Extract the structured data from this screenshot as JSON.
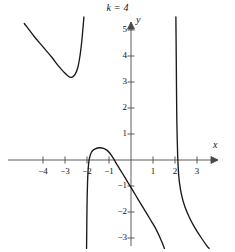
{
  "chart_data": {
    "type": "line",
    "title": "k = 4",
    "xlabel": "x",
    "ylabel": "y",
    "xlim": [
      -4.9,
      4.0
    ],
    "ylim": [
      -3.4,
      5.5
    ],
    "grid": false,
    "legend": null,
    "xticks": [
      -4,
      -3,
      -2,
      -1,
      1,
      2,
      3
    ],
    "xticklabels": [
      "-4",
      "-3",
      "-2",
      "-1",
      "1",
      "2",
      "3"
    ],
    "yticks": [
      5,
      4,
      3,
      2,
      1,
      -1,
      -2,
      -3
    ],
    "yticklabels": [
      "5",
      "4",
      "3",
      "2",
      "1",
      "-1",
      "-2",
      "-3"
    ],
    "asymptotes_vertical": [
      -2.05,
      2.05
    ],
    "annotations": [],
    "series": [
      {
        "name": "branch-left",
        "note": "upper-left branch, decreasing then rising to vertical asymptote x = -2.05; minimum about (-2.8, 3.2)",
        "points": [
          [
            -4.85,
            5.25
          ],
          [
            -4.4,
            4.75
          ],
          [
            -4.0,
            4.35
          ],
          [
            -3.6,
            3.95
          ],
          [
            -3.3,
            3.62
          ],
          [
            -3.05,
            3.38
          ],
          [
            -2.85,
            3.22
          ],
          [
            -2.7,
            3.18
          ],
          [
            -2.55,
            3.28
          ],
          [
            -2.42,
            3.55
          ],
          [
            -2.32,
            4.0
          ],
          [
            -2.24,
            4.55
          ],
          [
            -2.18,
            5.1
          ],
          [
            -2.14,
            5.5
          ]
        ]
      },
      {
        "name": "branch-middle",
        "note": "middle branch between asymptotes x = -2.05 and x = 2.05; local maximum about (-1.25, 0.45), falls through origin region to -3.4",
        "points": [
          [
            -2.02,
            -3.4
          ],
          [
            -2.01,
            -2.6
          ],
          [
            -2.0,
            -1.8
          ],
          [
            -1.98,
            -1.0
          ],
          [
            -1.95,
            -0.4
          ],
          [
            -1.9,
            0.02
          ],
          [
            -1.8,
            0.3
          ],
          [
            -1.65,
            0.42
          ],
          [
            -1.45,
            0.47
          ],
          [
            -1.25,
            0.45
          ],
          [
            -1.1,
            0.38
          ],
          [
            -0.95,
            0.25
          ],
          [
            -0.8,
            0.06
          ],
          [
            -0.62,
            -0.2
          ],
          [
            -0.4,
            -0.5
          ],
          [
            -0.15,
            -0.85
          ],
          [
            0.1,
            -1.2
          ],
          [
            0.35,
            -1.55
          ],
          [
            0.6,
            -1.9
          ],
          [
            0.85,
            -2.25
          ],
          [
            1.1,
            -2.6
          ],
          [
            1.3,
            -2.95
          ],
          [
            1.45,
            -3.25
          ],
          [
            1.52,
            -3.4
          ]
        ]
      },
      {
        "name": "branch-right",
        "note": "right branch, descends steeply from +5.5 at vertical asymptote x = 2.05, crosses x-axis near x = 2.1, continues down to -3.4",
        "points": [
          [
            2.04,
            5.5
          ],
          [
            2.05,
            4.6
          ],
          [
            2.06,
            3.6
          ],
          [
            2.07,
            2.6
          ],
          [
            2.08,
            1.7
          ],
          [
            2.1,
            0.85
          ],
          [
            2.12,
            0.2
          ],
          [
            2.15,
            -0.35
          ],
          [
            2.2,
            -0.85
          ],
          [
            2.3,
            -1.35
          ],
          [
            2.45,
            -1.8
          ],
          [
            2.65,
            -2.2
          ],
          [
            2.9,
            -2.6
          ],
          [
            3.2,
            -3.0
          ],
          [
            3.45,
            -3.3
          ],
          [
            3.55,
            -3.4
          ]
        ]
      }
    ]
  },
  "figure": {
    "title": "k = 4",
    "x_axis_label": "x",
    "y_axis_label": "y",
    "x_tick_labels": [
      "-4",
      "-3",
      "-2",
      "-1",
      "1",
      "2",
      "3"
    ],
    "y_tick_labels": [
      "5",
      "4",
      "3",
      "2",
      "1",
      "-1",
      "-2",
      "-3"
    ],
    "curve_color": "#1a1a1a",
    "axis_color": "#4a4a4a",
    "background_color": "#ffffff"
  }
}
